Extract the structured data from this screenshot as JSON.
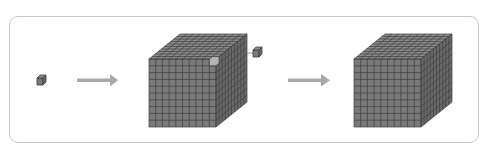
{
  "diagram": {
    "colors": {
      "frame_border": "#c8c8c8",
      "cube_front": "#7a7a7a",
      "cube_top": "#8c8c8c",
      "cube_side": "#6a6a6a",
      "grid_line": "#3c3c3c",
      "arrow": "#a8a8a8"
    },
    "grid": {
      "rows": 10,
      "cols": 10,
      "depth": 10
    },
    "steps": [
      {
        "id": "unit-cube",
        "label": "single unit cube"
      },
      {
        "id": "arrow-1",
        "label": "arrow"
      },
      {
        "id": "cube-with-detached-unit",
        "label": "large cube with one unit cube detached"
      },
      {
        "id": "arrow-2",
        "label": "arrow"
      },
      {
        "id": "complete-cube",
        "label": "complete large cube"
      }
    ]
  }
}
